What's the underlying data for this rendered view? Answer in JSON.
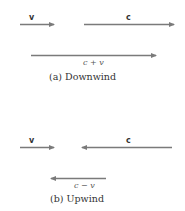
{
  "diagram": {
    "arrow_color": "#7a7a7a",
    "panel_a": {
      "caption": "(a) Downwind",
      "vector_v_label": "v",
      "vector_c_label": "c",
      "resultant_label": "c + v"
    },
    "panel_b": {
      "caption": "(b) Upwind",
      "vector_v_label": "v",
      "vector_c_label": "c",
      "resultant_label": "c − v"
    }
  }
}
